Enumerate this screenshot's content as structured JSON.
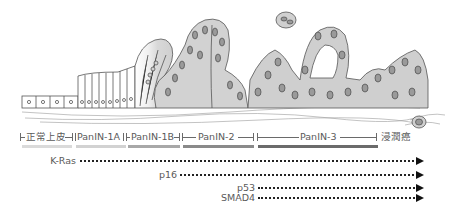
{
  "diagram": {
    "title": "",
    "stages": [
      {
        "label": "正常上皮",
        "bar_color": "#d9d9d9"
      },
      {
        "label": "PanIN-1A",
        "bar_color": "#d4d4d4"
      },
      {
        "label": "PanIN-1B",
        "bar_color": "#a9a9a9"
      },
      {
        "label": "PanIN-2",
        "bar_color": "#8a8a8a"
      },
      {
        "label": "PanIN-3",
        "bar_color": "#6e6e6e"
      },
      {
        "label": "浸潤癌",
        "bar_color": ""
      }
    ],
    "genes": [
      {
        "label": "K-Ras",
        "starts_at_stage": "PanIN-1A"
      },
      {
        "label": "p16",
        "starts_at_stage": "PanIN-2"
      },
      {
        "label": "p53",
        "starts_at_stage": "PanIN-3"
      },
      {
        "label": "SMAD4",
        "starts_at_stage": "PanIN-3"
      }
    ],
    "illustration": "pancreatic-duct-epithelium-progression"
  }
}
